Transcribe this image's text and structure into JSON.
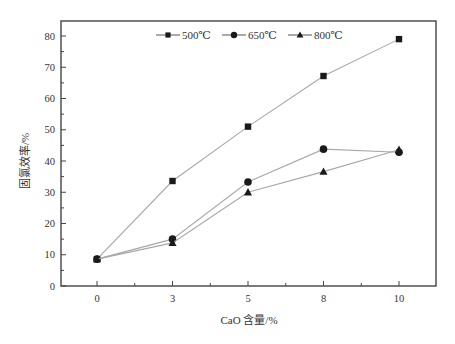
{
  "chart_data": {
    "type": "line",
    "title": "",
    "xlabel": "CaO 含量/%",
    "ylabel": "固氯效率/%",
    "categories": [
      "0",
      "3",
      "5",
      "8",
      "10"
    ],
    "x_is_categorical": true,
    "ylim": [
      0,
      85
    ],
    "yticks": [
      0,
      10,
      20,
      30,
      40,
      50,
      60,
      70,
      80
    ],
    "grid": false,
    "legend_position": "top-inside",
    "series": [
      {
        "name": "500℃",
        "marker": "square",
        "values": [
          8.6,
          33.6,
          51.0,
          67.2,
          79.0
        ]
      },
      {
        "name": "650℃",
        "marker": "circle",
        "values": [
          8.6,
          15.0,
          33.3,
          43.8,
          42.8
        ]
      },
      {
        "name": "800℃",
        "marker": "triangle",
        "values": [
          8.6,
          13.8,
          30.0,
          36.6,
          43.6
        ]
      }
    ]
  },
  "colors": {
    "line": "#a8a8a8",
    "marker": "#1a1a1a",
    "axis": "#444444",
    "text": "#333333"
  }
}
